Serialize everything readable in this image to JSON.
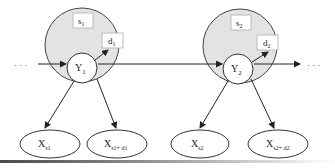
{
  "diagram": {
    "colors": {
      "region_fill": "#e3e3e3",
      "stroke": "#333333",
      "box_fill": "#ffffff",
      "box_stroke": "#bbbbbb"
    },
    "ellipsis_left": "· · ·",
    "ellipsis_right": "· · ·",
    "segments": [
      {
        "box_s": {
          "base": "s",
          "sub": "1"
        },
        "box_d": {
          "base": "d",
          "sub": "1"
        },
        "hidden": {
          "base": "Y",
          "sub": "1"
        },
        "obs_left": {
          "base": "X",
          "sub": "s1"
        },
        "obs_right": {
          "base": "X",
          "sub": "s1+ d1"
        }
      },
      {
        "box_s": {
          "base": "s",
          "sub": "2"
        },
        "box_d": {
          "base": "d",
          "sub": "2"
        },
        "hidden": {
          "base": "Y",
          "sub": "2"
        },
        "obs_left": {
          "base": "X",
          "sub": "s2"
        },
        "obs_right": {
          "base": "X",
          "sub": "s2+ d2"
        }
      }
    ]
  }
}
